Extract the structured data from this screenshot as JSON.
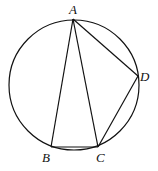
{
  "diagram": {
    "type": "geometry",
    "stroke_color": "#111111",
    "circle": {
      "cx": 74,
      "cy": 85,
      "r": 65
    },
    "points": {
      "A": {
        "label": "A",
        "x": 73,
        "y": 19,
        "lx": 69,
        "ly": 14
      },
      "B": {
        "label": "B",
        "x": 51,
        "y": 147,
        "lx": 42,
        "ly": 162
      },
      "C": {
        "label": "C",
        "x": 98,
        "y": 147,
        "lx": 96,
        "ly": 162
      },
      "D": {
        "label": "D",
        "x": 138,
        "y": 76,
        "lx": 140,
        "ly": 81
      }
    },
    "segments": [
      [
        "A",
        "B"
      ],
      [
        "A",
        "C"
      ],
      [
        "A",
        "D"
      ],
      [
        "B",
        "C"
      ],
      [
        "C",
        "D"
      ]
    ]
  }
}
